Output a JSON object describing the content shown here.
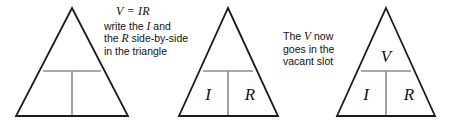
{
  "figure": {
    "background_color": "#ffffff",
    "outline_color": "#1a1a1a",
    "divider_color": "#8c8c8c",
    "text_color": "#111111"
  },
  "annotations": {
    "first": {
      "formula": "V = IR",
      "line1_a": "write the ",
      "line1_var": "I",
      "line1_b": " and",
      "line2_a": "the ",
      "line2_var": "R",
      "line2_b": " side-by-side",
      "line3": "in the triangle"
    },
    "second": {
      "line1_a": "The ",
      "line1_var": "V",
      "line1_b": " now",
      "line2": "goes in the",
      "line3": "vacant slot"
    }
  },
  "triangles": [
    {
      "name": "empty-triangle",
      "apex_x": 72,
      "apex_y": 8,
      "base_left_x": 16,
      "base_right_x": 128,
      "base_y": 116,
      "divider_y": 71,
      "vertical_x": 72,
      "labels": {
        "top": "",
        "bottom_left": "",
        "bottom_right": ""
      }
    },
    {
      "name": "triangle-with-i-and-r",
      "apex_x": 228,
      "apex_y": 8,
      "base_left_x": 179,
      "base_right_x": 278,
      "base_y": 116,
      "divider_y": 71,
      "vertical_x": 228,
      "labels": {
        "top": "",
        "bottom_left": "I",
        "bottom_right": "R"
      }
    },
    {
      "name": "triangle-with-v-i-and-r",
      "apex_x": 386,
      "apex_y": 8,
      "base_left_x": 337,
      "base_right_x": 435,
      "base_y": 116,
      "divider_y": 71,
      "vertical_x": 386,
      "labels": {
        "top": "V",
        "bottom_left": "I",
        "bottom_right": "R"
      }
    }
  ]
}
